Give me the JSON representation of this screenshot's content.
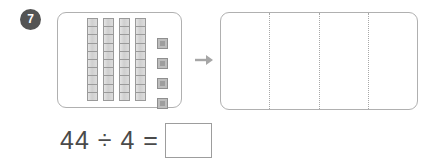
{
  "question": {
    "number": "7",
    "equation_text": "44 ÷ 4 =",
    "answer_value": "",
    "dividend": 44,
    "divisor": 4
  },
  "source_panel": {
    "label": "base-ten-blocks",
    "tens_rods": 4,
    "cells_per_rod": 10,
    "unit_cubes": 4,
    "total_value": 44
  },
  "share_group": {
    "label": "equal-groups",
    "group_count": 4,
    "groups": [
      {
        "contents": ""
      },
      {
        "contents": ""
      },
      {
        "contents": ""
      },
      {
        "contents": ""
      }
    ]
  },
  "arrow": {
    "icon": "arrow-right-icon",
    "direction": "right"
  },
  "colors": {
    "badge_background": "#545454",
    "badge_text": "#ffffff",
    "panel_border": "#b0b0b0",
    "rod_fill": "#d9d9d9",
    "rod_border": "#9a9a9a",
    "unit_fill": "#bdbdbd",
    "unit_inner": "#9e9e9e",
    "divider": "#a8a8a8",
    "equation_text": "#4a4a4a",
    "answer_box_border": "#9d9d9d",
    "arrow": "#a6a6a6",
    "page_background": "#ffffff"
  }
}
